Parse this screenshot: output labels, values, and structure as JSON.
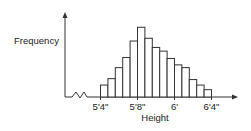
{
  "chart_data": {
    "type": "bar",
    "subtype": "histogram",
    "title": "",
    "xlabel": "Height",
    "ylabel": "Frequency",
    "x_tick_labels": [
      "5'4\"",
      "5'8\"",
      "6'",
      "6'4\""
    ],
    "x_tick_values_inches": [
      64,
      68,
      72,
      76
    ],
    "xlim_inches": [
      64,
      76
    ],
    "bin_count": 15,
    "bin_edges_inches": [
      64,
      64.8,
      65.6,
      66.4,
      67.2,
      68,
      68.8,
      69.6,
      70.4,
      71.2,
      72,
      72.8,
      73.6,
      74.4,
      75.2,
      76
    ],
    "values": [
      13,
      20,
      32,
      43,
      61,
      76,
      64,
      54,
      50,
      42,
      35,
      32,
      19,
      13,
      8
    ],
    "ylim": [
      0,
      85
    ],
    "y_ticks_shown": false,
    "grid": false,
    "axis_break": true,
    "colors": {
      "bar_fill": "#ffffff",
      "stroke": "#333333",
      "text": "#222222"
    }
  }
}
